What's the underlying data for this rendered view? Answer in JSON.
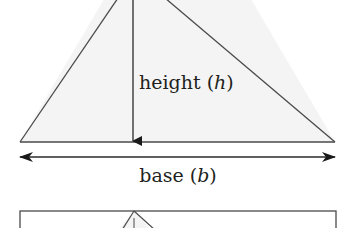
{
  "diagram": {
    "colors": {
      "stroke": "#3a3a3a",
      "fill": "#f4f4f4",
      "text": "#231f20"
    },
    "main_triangle": {
      "height_label": "height",
      "height_var": "h",
      "base_label": "base",
      "base_var": "b"
    },
    "second_figure": {
      "shape": "rectangle with inscribed triangle (partially visible)"
    }
  }
}
